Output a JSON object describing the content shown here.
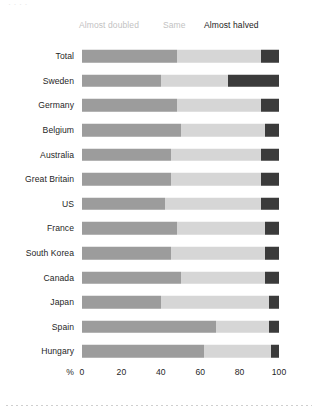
{
  "title_sliver": "·  ·   ·    ·",
  "legend": {
    "items": [
      {
        "label": "Almost doubled",
        "color": "#9c9c9c",
        "text_color": "#c2c2c2"
      },
      {
        "label": "Same",
        "color": "#d6d6d6",
        "text_color": "#c2c2c2"
      },
      {
        "label": "Almost halved",
        "color": "#3b3b3b",
        "text_color": "#1c1c1c"
      }
    ]
  },
  "axis": {
    "unit_label": "%",
    "ticks": [
      0,
      20,
      40,
      60,
      80,
      100
    ]
  },
  "chart_data": {
    "type": "bar",
    "orientation": "horizontal",
    "stacked": true,
    "stacked_percent": true,
    "title": "",
    "subtitle": "",
    "xlabel": "%",
    "ylabel": "",
    "xlim": [
      0,
      100
    ],
    "xticks": [
      0,
      20,
      40,
      60,
      80,
      100
    ],
    "grid": false,
    "legend_position": "top",
    "categories": [
      "Total",
      "Sweden",
      "Germany",
      "Belgium",
      "Australia",
      "Great Britain",
      "US",
      "France",
      "South Korea",
      "Canada",
      "Japan",
      "Spain",
      "Hungary"
    ],
    "series": [
      {
        "name": "Almost doubled",
        "color": "#9c9c9c",
        "values": [
          48,
          40,
          48,
          50,
          45,
          45,
          42,
          48,
          45,
          50,
          40,
          68,
          62
        ]
      },
      {
        "name": "Same",
        "color": "#d6d6d6",
        "values": [
          43,
          34,
          43,
          43,
          46,
          46,
          49,
          45,
          48,
          43,
          55,
          27,
          34
        ]
      },
      {
        "name": "Almost halved",
        "color": "#3b3b3b",
        "values": [
          9,
          26,
          9,
          7,
          9,
          9,
          9,
          7,
          7,
          7,
          5,
          5,
          4
        ]
      }
    ]
  }
}
